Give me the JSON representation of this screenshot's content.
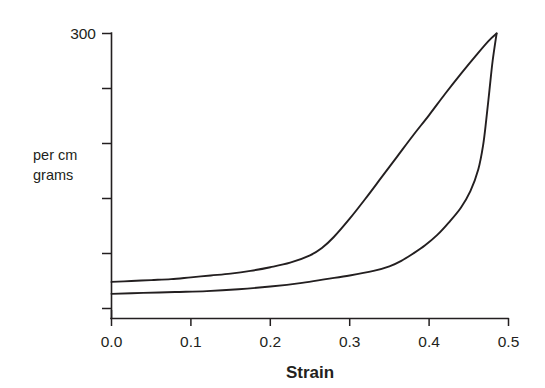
{
  "chart_data": {
    "type": "line",
    "title": "",
    "subtitle": "",
    "xlabel": "Strain",
    "ylabel": "per cm grams",
    "ylabel_lines": [
      "per cm",
      "grams"
    ],
    "xlim": [
      0.0,
      0.5
    ],
    "ylim": [
      0,
      300
    ],
    "grid": false,
    "legend": "none",
    "x_ticks": [
      0.0,
      0.1,
      0.2,
      0.3,
      0.4,
      0.5
    ],
    "x_tick_labels": [
      "0.0",
      "0.1",
      "0.2",
      "0.3",
      "0.4",
      "0.5"
    ],
    "y_ticks": [
      0,
      60,
      120,
      180,
      240,
      300
    ],
    "y_tick_labels": [
      "",
      "",
      "",
      "",
      "",
      "300"
    ],
    "series": [
      {
        "name": "loading",
        "points": [
          [
            0.0,
            29
          ],
          [
            0.025,
            30
          ],
          [
            0.05,
            31
          ],
          [
            0.075,
            32
          ],
          [
            0.1,
            34
          ],
          [
            0.125,
            36
          ],
          [
            0.15,
            38
          ],
          [
            0.175,
            41
          ],
          [
            0.2,
            45
          ],
          [
            0.225,
            50
          ],
          [
            0.25,
            58
          ],
          [
            0.265,
            66
          ],
          [
            0.28,
            78
          ],
          [
            0.3,
            98
          ],
          [
            0.32,
            120
          ],
          [
            0.34,
            143
          ],
          [
            0.36,
            166
          ],
          [
            0.38,
            189
          ],
          [
            0.4,
            211
          ],
          [
            0.42,
            234
          ],
          [
            0.44,
            256
          ],
          [
            0.46,
            277
          ],
          [
            0.475,
            292
          ],
          [
            0.485,
            300
          ]
        ]
      },
      {
        "name": "unloading",
        "points": [
          [
            0.485,
            300
          ],
          [
            0.48,
            270
          ],
          [
            0.476,
            238
          ],
          [
            0.472,
            206
          ],
          [
            0.468,
            178
          ],
          [
            0.462,
            152
          ],
          [
            0.452,
            128
          ],
          [
            0.44,
            110
          ],
          [
            0.425,
            94
          ],
          [
            0.41,
            80
          ],
          [
            0.395,
            69
          ],
          [
            0.38,
            60
          ],
          [
            0.365,
            52
          ],
          [
            0.35,
            46
          ],
          [
            0.33,
            41
          ],
          [
            0.3,
            36
          ],
          [
            0.27,
            32
          ],
          [
            0.24,
            28
          ],
          [
            0.2,
            24
          ],
          [
            0.16,
            21
          ],
          [
            0.12,
            19
          ],
          [
            0.08,
            18
          ],
          [
            0.04,
            17
          ],
          [
            0.0,
            16
          ]
        ]
      }
    ],
    "annotations": []
  },
  "axes": {
    "x_title": "Strain",
    "y_title_line1": "per cm",
    "y_title_line2": "grams",
    "y_top_label": "300",
    "x_labels": [
      "0.0",
      "0.1",
      "0.2",
      "0.3",
      "0.4",
      "0.5"
    ]
  },
  "colors": {
    "ink": "#231f20",
    "background": "#ffffff"
  }
}
